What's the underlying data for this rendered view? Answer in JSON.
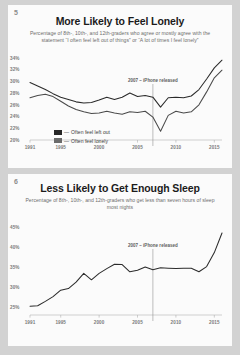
{
  "page": {
    "background": "#d2d2d2"
  },
  "panels": [
    {
      "number": "5",
      "title": "More Likely to Feel Lonely",
      "subtitle": "Percentage of 8th-, 10th-, and 12th-graders who agree or mostly agree with the statement “I often feel left out of things” or “A lot of times I feel lonely”",
      "annotation": "2007 – iPhone released",
      "legend": [
        {
          "label": "Often feel left out",
          "color": "#262626",
          "dash": "—"
        },
        {
          "label": "Often feel lonely",
          "color": "#6b6b6b",
          "dash": "—"
        }
      ]
    },
    {
      "number": "6",
      "title": "Less Likely to Get Enough Sleep",
      "subtitle": "Percentage of 8th-, 10th-, and 12th-graders who get less than seven hours of sleep most nights",
      "annotation": "2007 – iPhone released"
    }
  ],
  "chart_data": [
    {
      "type": "line",
      "title": "More Likely to Feel Lonely",
      "subtitle": "Percentage of 8th-, 10th-, and 12th-graders who agree or mostly agree with the statement “I often feel left out of things” or “A lot of times I feel lonely”",
      "xlabel": "",
      "ylabel": "",
      "grid": false,
      "legend_position": "inside-bottom-left",
      "ylim": [
        20,
        35
      ],
      "xlim": [
        1991,
        2016
      ],
      "yticks": [
        "20%",
        "22%",
        "24%",
        "26%",
        "28%",
        "30%",
        "32%",
        "34%"
      ],
      "ytick_values": [
        20,
        22,
        24,
        26,
        28,
        30,
        32,
        34
      ],
      "xticks": [
        "1991",
        "1995",
        "2000",
        "2005",
        "2010",
        "2015"
      ],
      "xtick_values": [
        1991,
        1995,
        2000,
        2005,
        2010,
        2015
      ],
      "annotations": [
        {
          "text": "2007 – iPhone released",
          "x": 2007,
          "type": "vertical-line"
        }
      ],
      "x": [
        1991,
        1992,
        1993,
        1994,
        1995,
        1996,
        1997,
        1998,
        1999,
        2000,
        2001,
        2002,
        2003,
        2004,
        2005,
        2006,
        2007,
        2008,
        2009,
        2010,
        2011,
        2012,
        2013,
        2014,
        2015,
        2016
      ],
      "series": [
        {
          "name": "Often feel left out",
          "color": "#2b2b2b",
          "values": [
            29.8,
            29.2,
            28.6,
            27.9,
            27.3,
            26.9,
            26.5,
            26.3,
            26.4,
            26.8,
            27.3,
            26.9,
            27.3,
            28.0,
            27.4,
            27.6,
            27.3,
            25.6,
            27.2,
            27.3,
            27.2,
            27.5,
            28.6,
            30.4,
            32.3,
            33.6
          ]
        },
        {
          "name": "Often feel lonely",
          "color": "#4a4a4a",
          "values": [
            27.2,
            27.6,
            27.8,
            27.4,
            26.6,
            25.8,
            25.2,
            24.8,
            24.5,
            24.6,
            24.9,
            24.6,
            24.4,
            24.8,
            24.7,
            24.9,
            23.9,
            21.5,
            24.2,
            24.9,
            24.6,
            24.8,
            26.0,
            28.2,
            30.6,
            31.9
          ]
        }
      ]
    },
    {
      "type": "line",
      "title": "Less Likely to Get Enough Sleep",
      "subtitle": "Percentage of 8th-, 10th-, and 12th-graders who get less than seven hours of sleep most nights",
      "xlabel": "",
      "ylabel": "",
      "grid": false,
      "ylim": [
        23,
        47
      ],
      "xlim": [
        1991,
        2016
      ],
      "yticks": [
        "25%",
        "30%",
        "35%",
        "40%",
        "45%"
      ],
      "ytick_values": [
        25,
        30,
        35,
        40,
        45
      ],
      "xticks": [
        "1991",
        "1995",
        "2000",
        "2005",
        "2010",
        "2015"
      ],
      "xtick_values": [
        1991,
        1995,
        2000,
        2005,
        2010,
        2015
      ],
      "annotations": [
        {
          "text": "2007 – iPhone released",
          "x": 2007,
          "type": "vertical-line"
        }
      ],
      "x": [
        1991,
        1992,
        1993,
        1994,
        1995,
        1996,
        1997,
        1998,
        1999,
        2000,
        2001,
        2002,
        2003,
        2004,
        2005,
        2006,
        2007,
        2008,
        2009,
        2010,
        2011,
        2012,
        2013,
        2014,
        2015,
        2016
      ],
      "series": [
        {
          "name": "Gets less than seven hours of sleep",
          "color": "#2b2b2b",
          "values": [
            25.2,
            25.3,
            26.4,
            27.6,
            29.2,
            29.6,
            31.2,
            33.4,
            31.8,
            33.4,
            34.6,
            35.7,
            35.6,
            33.8,
            34.2,
            35.0,
            34.3,
            34.8,
            34.7,
            34.6,
            34.7,
            34.7,
            33.8,
            35.1,
            38.6,
            43.5
          ]
        }
      ]
    }
  ]
}
